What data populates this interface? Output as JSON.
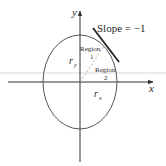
{
  "diagram": {
    "axis_x_label": "x",
    "axis_y_label": "y",
    "slope_label": "Slope = −1",
    "region1": {
      "line1": "Region",
      "line2": "1"
    },
    "region2": {
      "line1": "Region",
      "line2": "2"
    },
    "radius_y_label": "r",
    "radius_y_sub": "y",
    "radius_x_label": "r",
    "radius_x_sub": "x",
    "colors": {
      "ellipse": "#555555",
      "axes": "#333333",
      "tangent": "#222222",
      "dashed": "#999999",
      "band": "#ebebeb"
    }
  }
}
